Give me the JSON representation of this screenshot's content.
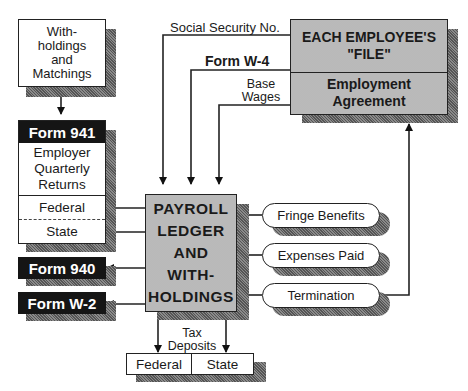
{
  "withholdings_box": {
    "label_lines": [
      "With-",
      "holdings",
      "and",
      "Matchings"
    ]
  },
  "form941": {
    "title": "Form 941",
    "description_lines": [
      "Employer",
      "Quarterly",
      "Returns"
    ],
    "federal": "Federal",
    "state": "State"
  },
  "form940": {
    "title": "Form 940"
  },
  "formW2": {
    "title": "Form W-2"
  },
  "employee_file": {
    "title_line1": "EACH EMPLOYEE'S",
    "title_line2": "\"FILE\"",
    "agreement_line1": "Employment",
    "agreement_line2": "Agreement"
  },
  "connectors": {
    "ssn": "Social Security No.",
    "w4": "Form W-4",
    "base_wages_line1": "Base",
    "base_wages_line2": "Wages",
    "tax_deposits_line1": "Tax",
    "tax_deposits_line2": "Deposits"
  },
  "payroll_ledger": {
    "lines": [
      "PAYROLL",
      "LEDGER",
      "AND",
      "WITH-",
      "HOLDINGS"
    ]
  },
  "inputs": [
    {
      "label": "Fringe Benefits"
    },
    {
      "label": "Expenses Paid"
    },
    {
      "label": "Termination"
    }
  ],
  "tax_deposit_boxes": {
    "federal": "Federal",
    "state": "State"
  }
}
